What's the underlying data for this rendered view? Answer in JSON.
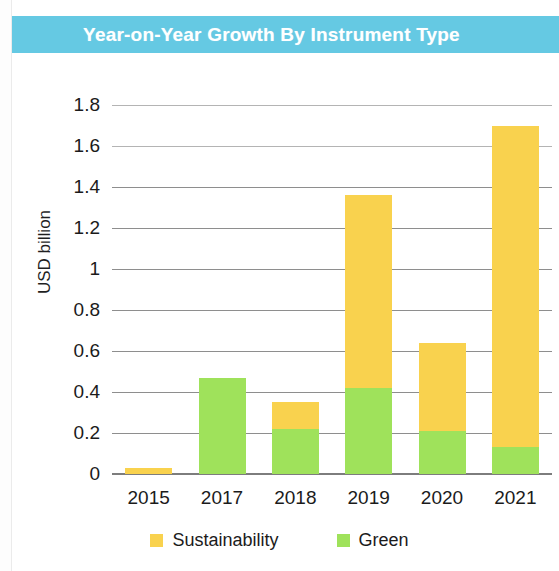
{
  "header": {
    "title": "Year-on-Year Growth By Instrument Type",
    "banner_color": "#65c9e3",
    "title_color": "#ffffff"
  },
  "chart_data": {
    "type": "bar",
    "subtype": "stacked-bar",
    "title": "Year-on-Year Growth By Instrument Type",
    "xlabel": "",
    "ylabel": "USD billion",
    "categories": [
      "2015",
      "2017",
      "2018",
      "2019",
      "2020",
      "2021"
    ],
    "series": [
      {
        "name": "Green",
        "color": "#9fe25b",
        "values": [
          0,
          0.47,
          0.22,
          0.42,
          0.21,
          0.13
        ]
      },
      {
        "name": "Sustainability",
        "color": "#f9d24e",
        "values": [
          0.03,
          0,
          0.13,
          0.94,
          0.43,
          1.57
        ]
      }
    ],
    "totals": [
      0.03,
      0.47,
      0.35,
      1.36,
      0.64,
      1.7
    ],
    "ylim": [
      0,
      1.8
    ],
    "ytick_values": [
      0,
      0.2,
      0.4,
      0.6,
      0.8,
      1,
      1.2,
      1.4,
      1.6,
      1.8
    ],
    "ytick_labels": [
      "0",
      "0.2",
      "0.4",
      "0.6",
      "0.8",
      "1",
      "1.2",
      "1.4",
      "1.6",
      "1.8"
    ],
    "grid": true,
    "grid_axis": "y",
    "legend_position": "bottom",
    "stack_order": [
      "Green",
      "Sustainability"
    ]
  },
  "legend": {
    "items": [
      {
        "label": "Sustainability",
        "color": "#f9d24e"
      },
      {
        "label": "Green",
        "color": "#9fe25b"
      }
    ]
  }
}
